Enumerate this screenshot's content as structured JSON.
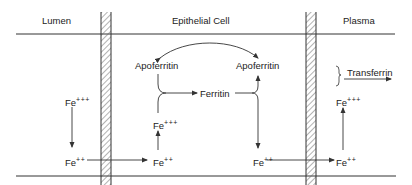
{
  "regions": {
    "lumen": "Lumen",
    "epithelial_cell": "Epithelial Cell",
    "plasma": "Plasma"
  },
  "species": {
    "apoferritin_left": "Apoferritin",
    "apoferritin_right": "Apoferritin",
    "ferritin": "Ferritin",
    "transferrin": "Transferrin",
    "fe_base": "Fe",
    "ferric_charge": "+++",
    "ferrous_charge": "++"
  },
  "colors": {
    "line": "#333333",
    "hatch": "#555555",
    "text": "#222222",
    "background": "#ffffff"
  }
}
